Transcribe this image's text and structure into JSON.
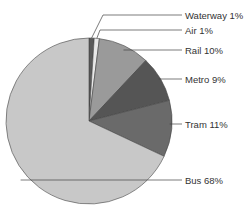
{
  "chart_data": {
    "type": "pie",
    "title": "",
    "categories": [
      "Waterway",
      "Air",
      "Rail",
      "Metro",
      "Tram",
      "Bus"
    ],
    "values": [
      1,
      1,
      10,
      9,
      11,
      68
    ],
    "unit": "%",
    "start_angle": "12 o'clock, clockwise",
    "legend": "none (leader-line labels on right)",
    "labels": [
      "Waterway 1%",
      "Air 1%",
      "Rail 10%",
      "Metro 9%",
      "Tram 11%",
      "Bus 68%"
    ],
    "colors": [
      "#5a5a5a",
      "#e8e8e8",
      "#9a9a9a",
      "#555555",
      "#6a6a6a",
      "#c8c8c8"
    ]
  },
  "layout": {
    "cx": 89,
    "cy": 121,
    "r": 83,
    "label_x": 185,
    "label_y": [
      15,
      30,
      50,
      79,
      124,
      180
    ]
  }
}
